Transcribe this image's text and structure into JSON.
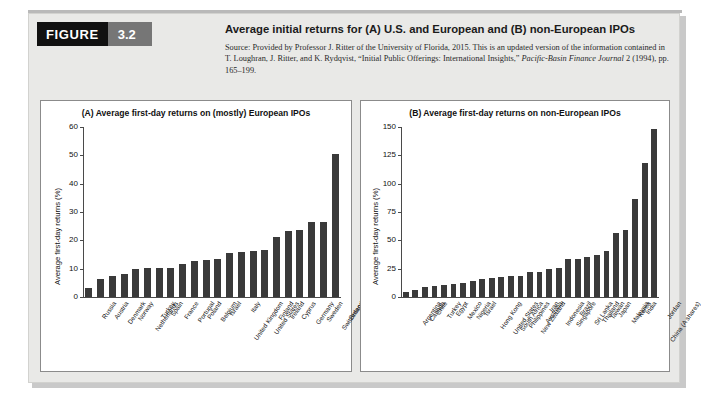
{
  "figure": {
    "badge_word": "FIGURE",
    "badge_number": "3.2",
    "title": "Average initial returns for (A) U.S. and European and (B) non-European IPOs",
    "source_line1": "Source: Provided by Professor J. Ritter of the University of Florida, 2015. This is an updated version of the information",
    "source_line2a": "contained in T. Loughran, J. Ritter, and K. Rydqvist, “Initial Public Offerings: International Insights,” ",
    "source_line2b": "Pacific-Basin Finance",
    "source_line3a": "Journal",
    "source_line3b": " 2 (1994), pp. 165–199."
  },
  "colors": {
    "bar": "#3a3a3a",
    "panel_background": "#e9e9e7",
    "chart_background": "#ffffff",
    "axis": "#4a4a4a",
    "badge_black": "#111111",
    "badge_gray": "#767676"
  },
  "chart_data": [
    {
      "id": "A",
      "type": "bar",
      "title": "(A) Average first-day returns on (mostly) European IPOs",
      "xlabel": "",
      "ylabel": "Average first-day returns (%)",
      "ylim": [
        0,
        60
      ],
      "yticks": [
        0,
        10,
        20,
        30,
        40,
        50,
        60
      ],
      "grid": false,
      "legend": "none",
      "categories": [
        "Russia",
        "Austria",
        "Denmark",
        "Norway",
        "Netherlands",
        "Turkey",
        "Spain",
        "France",
        "Portugal",
        "Poland",
        "Belgium",
        "Israel",
        "United Kingdom",
        "Italy",
        "United States",
        "Finland",
        "Ireland",
        "Cyprus",
        "Germany",
        "Sweden",
        "Switzerland",
        "Greece"
      ],
      "values": [
        3.3,
        6.3,
        7.4,
        8.1,
        10.0,
        10.2,
        10.2,
        10.4,
        11.6,
        12.8,
        13.1,
        13.4,
        15.6,
        15.9,
        16.4,
        16.7,
        21.2,
        23.2,
        23.7,
        26.6,
        26.6,
        50.3
      ]
    },
    {
      "id": "B",
      "type": "bar",
      "title": "(B) Average first-day returns on non-European IPOs",
      "xlabel": "",
      "ylabel": "Average first-day returns (%)",
      "ylim": [
        0,
        150
      ],
      "yticks": [
        0,
        25,
        50,
        75,
        100,
        125,
        150
      ],
      "grid": false,
      "legend": "none",
      "categories": [
        "Argentina",
        "Canada",
        "Chile",
        "Turkey",
        "Egypt",
        "Mexico",
        "Nigeria",
        "Israel",
        "Hong Kong",
        "United States",
        "South Africa",
        "Philippines",
        "New Zealand",
        "Australia",
        "Iran",
        "Indonesia",
        "Singapore",
        "Brazil",
        "Sri Lanka",
        "Thailand",
        "Taiwan",
        "Japan",
        "Malaysia",
        "Korea",
        "India",
        "China (A shares)",
        "Jordan"
      ],
      "values": [
        4.4,
        6.5,
        8.4,
        10.0,
        10.4,
        11.6,
        12.7,
        13.8,
        15.8,
        16.5,
        17.4,
        18.1,
        18.6,
        21.8,
        22.3,
        24.9,
        25.8,
        33.1,
        33.5,
        35.1,
        37.2,
        40.2,
        56.2,
        58.8,
        86.5,
        118.4,
        148.0
      ]
    }
  ]
}
